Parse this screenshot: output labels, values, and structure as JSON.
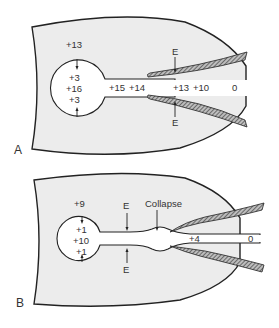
{
  "colors": {
    "background": "#ffffff",
    "thorax_fill": "#ececec",
    "outline": "#222222",
    "text": "#333333",
    "hatch": "#555555"
  },
  "panels": [
    {
      "label": "A",
      "pleural_pressure": "+13",
      "alveolar_values": [
        "+3",
        "+16",
        "+3"
      ],
      "airway_values": [
        "+15",
        "+14",
        "+13",
        "+10",
        "0"
      ],
      "epp_markers": [
        "E",
        "E"
      ]
    },
    {
      "label": "B",
      "pleural_pressure": "+9",
      "alveolar_values": [
        "+1",
        "+10",
        "+1"
      ],
      "airway_values": [
        "+4",
        "0"
      ],
      "epp_markers": [
        "E",
        "E"
      ],
      "collapse_label": "Collapse"
    }
  ]
}
